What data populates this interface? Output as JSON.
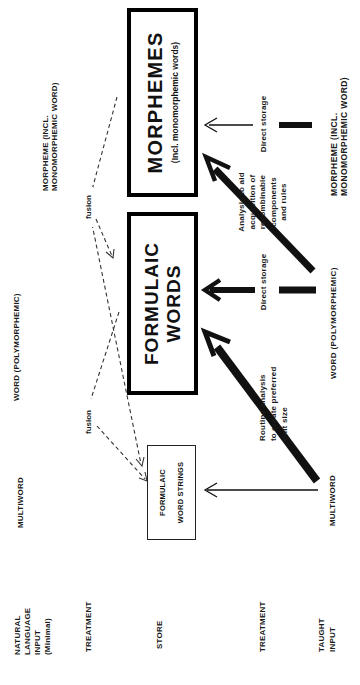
{
  "figure": {
    "colors": {
      "ink": "#1a1a1a",
      "background": "#ffffff"
    },
    "row_headers": {
      "natural_input": "NATURAL\nLANGUAGE\nINPUT\n(Minimal)",
      "treatment_upper": "TREATMENT",
      "store": "STORE",
      "treatment_lower": "TREATMENT",
      "taught_input": "TAUGHT\nINPUT"
    },
    "input_row": {
      "multiword": "MULTIWORD",
      "word": "WORD (POLYMORPHEMIC)",
      "morpheme": "MORPHEME (INCL.\nMONOMORPHEMIC WORD)"
    },
    "fusion_labels": {
      "left": "fusion",
      "right": "fusion"
    },
    "store_boxes": {
      "word_strings": "FORMULAIC\nWORD STRINGS",
      "formulaic_words": "FORMULAIC\nWORDS",
      "morphemes_title": "MORPHEMES",
      "morphemes_subtitle": "(Incl. monomorphemic words)"
    },
    "treatment_row": {
      "routine_analysis": "Routine analysis\nto create preferred\nunit size",
      "direct_storage_word": "Direct storage",
      "analysis_aid": "Analysis to aid\nacquisition of\nrecombinable\ncomponents\nand rules",
      "direct_storage_morpheme": "Direct storage"
    },
    "taught_row": {
      "multiword": "MULTIWORD",
      "word": "WORD  (POLYMORPHEMIC)",
      "morpheme": "MORPHEME (INCL.\nMONOMORPHEMIC WORD)"
    }
  }
}
